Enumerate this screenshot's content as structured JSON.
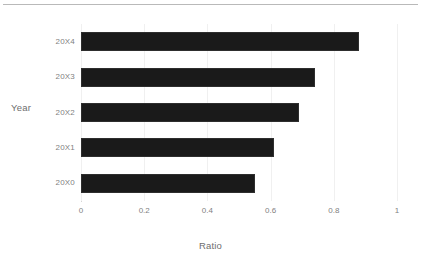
{
  "figure": {
    "top_rule": "",
    "clipped_caption": ""
  },
  "chart_data": {
    "type": "bar",
    "orientation": "horizontal",
    "title": "",
    "categories": [
      "20X0",
      "20X1",
      "20X2",
      "20X3",
      "20X4"
    ],
    "values": [
      0.55,
      0.61,
      0.69,
      0.74,
      0.88
    ],
    "xlabel": "Ratio",
    "ylabel": "Year",
    "xlim": [
      0,
      1
    ],
    "xticks": [
      0,
      0.2,
      0.4,
      0.6,
      0.8,
      1
    ],
    "xtick_labels": [
      "0",
      "0.2",
      "0.4",
      "0.6",
      "0.8",
      "1"
    ],
    "grid": "vertical",
    "legend": null,
    "bar_color": "#1a1a1a",
    "grid_color": "#f0f0f0",
    "axis_color": "#d5d5d5",
    "text_color": "#7f7f7f",
    "display_order_top_to_bottom": [
      "20X4",
      "20X3",
      "20X2",
      "20X1",
      "20X0"
    ]
  }
}
